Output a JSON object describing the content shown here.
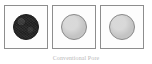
{
  "figure": {
    "caption": "Conventional Pore",
    "background_color": "#ffffff",
    "panel_count": 3,
    "panels": [
      {
        "index": "1",
        "name": "panel-dark-disc",
        "shape": "circle",
        "fill_color": "#2f2f2f",
        "outline_color": "#1c1c1c",
        "frame_color": "#8d8d8d",
        "texture": "mottled",
        "alt": "dark textured circle inside square frame"
      },
      {
        "index": "2",
        "name": "panel-light-disc-a",
        "shape": "circle",
        "fill_color": "#c4c4c4",
        "outline_color": "#8a8a8a",
        "frame_color": "#8d8d8d",
        "texture": "smooth",
        "alt": "light gray circle inside square frame"
      },
      {
        "index": "3",
        "name": "panel-light-disc-b",
        "shape": "circle",
        "fill_color": "#c6c6c6",
        "outline_color": "#8a8a8a",
        "frame_color": "#8d8d8d",
        "texture": "smooth",
        "alt": "light gray circle inside square frame"
      }
    ]
  }
}
